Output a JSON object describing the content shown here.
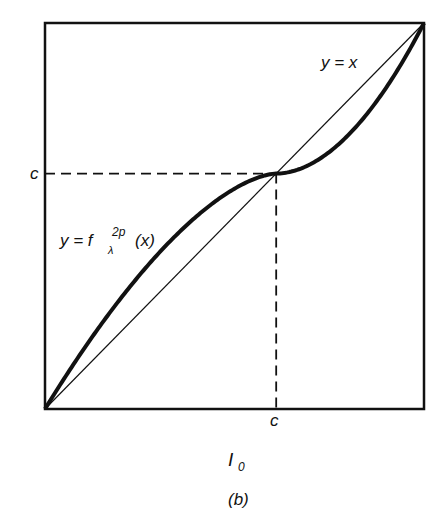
{
  "chart_data": {
    "type": "line",
    "title": "",
    "panel_label": "(b)",
    "xlabel": "I",
    "xlabel_sub": "0",
    "xlim": [
      0,
      1
    ],
    "ylim": [
      0,
      1
    ],
    "fixed_point": {
      "x": 0.61,
      "y": 0.61,
      "x_label": "c",
      "y_label": "c"
    },
    "series": [
      {
        "name": "y = x",
        "label": "y = x",
        "style": "thin"
      },
      {
        "name": "y = f_λ^{2p}(x)",
        "label_main": "y = f",
        "label_sup": "2p",
        "label_sub": "λ",
        "label_arg": "(x)",
        "style": "thick"
      }
    ],
    "grid": false
  }
}
